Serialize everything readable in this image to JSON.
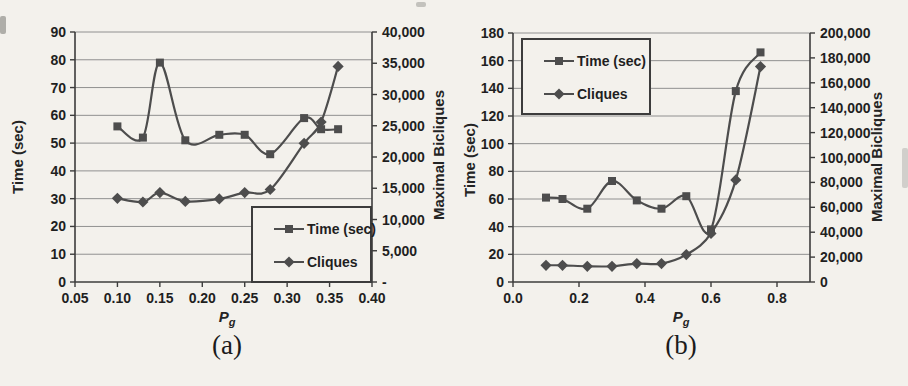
{
  "figure": {
    "paper_color": "#f3f1ec",
    "series_color": "#4d4d4d",
    "grid_color": "#909090",
    "axis_color": "#3c3c3c",
    "text_color": "#1f1f1f"
  },
  "chart_data": [
    {
      "type": "line",
      "caption": "(a)",
      "x_axis": {
        "label_main": "P",
        "label_sub": "g",
        "min": 0.05,
        "max": 0.4,
        "ticks": [
          "0.05",
          "0.10",
          "0.15",
          "0.20",
          "0.25",
          "0.30",
          "0.35",
          "0.40"
        ]
      },
      "left_axis": {
        "label": "Time (sec)",
        "min": 0,
        "max": 90,
        "ticks": [
          "0",
          "10",
          "20",
          "30",
          "40",
          "50",
          "60",
          "70",
          "80",
          "90"
        ]
      },
      "right_axis": {
        "label": "Maximal Bicliques",
        "min": 0,
        "max": 40000,
        "ticks": [
          "-",
          "5,000",
          "10,000",
          "15,000",
          "20,000",
          "25,000",
          "30,000",
          "35,000",
          "40,000"
        ]
      },
      "legend": {
        "position": "bottom-right",
        "entries": [
          {
            "label": "Time (sec)",
            "marker": "square"
          },
          {
            "label": "Cliques",
            "marker": "diamond"
          }
        ]
      },
      "series": [
        {
          "name": "Time (sec)",
          "axis": "left",
          "marker": "square",
          "x": [
            0.1,
            0.13,
            0.15,
            0.18,
            0.22,
            0.25,
            0.28,
            0.32,
            0.34,
            0.36
          ],
          "y": [
            56,
            52,
            79,
            51,
            53,
            53,
            46,
            59,
            55,
            55
          ]
        },
        {
          "name": "Cliques",
          "axis": "right",
          "marker": "diamond",
          "x": [
            0.1,
            0.13,
            0.15,
            0.18,
            0.22,
            0.25,
            0.28,
            0.32,
            0.34,
            0.36
          ],
          "y": [
            13400,
            12800,
            14300,
            12900,
            13300,
            14300,
            14800,
            22200,
            25600,
            34500
          ]
        }
      ]
    },
    {
      "type": "line",
      "caption": "(b)",
      "x_axis": {
        "label_main": "P",
        "label_sub": "g",
        "min": 0.0,
        "max": 0.9,
        "ticks": [
          "0.0",
          "0.2",
          "0.4",
          "0.6",
          "0.8"
        ]
      },
      "left_axis": {
        "label": "Time (sec)",
        "min": 0,
        "max": 180,
        "ticks": [
          "0",
          "20",
          "40",
          "60",
          "80",
          "100",
          "120",
          "140",
          "160",
          "180"
        ]
      },
      "right_axis": {
        "label": "Maximal Bicliques",
        "min": 0,
        "max": 200000,
        "ticks": [
          "0",
          "20,000",
          "40,000",
          "60,000",
          "80,000",
          "100,000",
          "120,000",
          "140,000",
          "160,000",
          "180,000",
          "200,000"
        ]
      },
      "legend": {
        "position": "top-left",
        "entries": [
          {
            "label": "Time (sec)",
            "marker": "square"
          },
          {
            "label": "Cliques",
            "marker": "diamond"
          }
        ]
      },
      "series": [
        {
          "name": "Time (sec)",
          "axis": "left",
          "marker": "square",
          "x": [
            0.1,
            0.15,
            0.225,
            0.3,
            0.375,
            0.45,
            0.525,
            0.6,
            0.675,
            0.75
          ],
          "y": [
            61,
            60,
            53,
            73,
            59,
            53,
            62,
            38,
            138,
            166
          ]
        },
        {
          "name": "Cliques",
          "axis": "right",
          "marker": "diamond",
          "x": [
            0.1,
            0.15,
            0.225,
            0.3,
            0.375,
            0.45,
            0.525,
            0.6,
            0.675,
            0.75
          ],
          "y": [
            13400,
            13400,
            12600,
            12600,
            14800,
            14800,
            22000,
            39000,
            82000,
            173000
          ]
        }
      ]
    }
  ]
}
